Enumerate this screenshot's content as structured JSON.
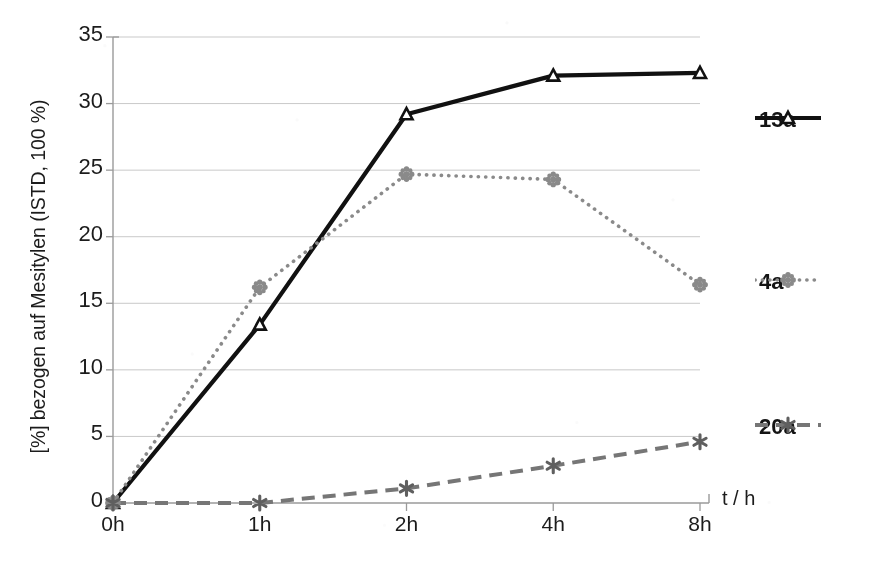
{
  "chart_data": {
    "type": "line",
    "title": "",
    "subtitle": "",
    "xlabel": "t / h",
    "ylabel": "[%] bezogen auf Mesitylen (ISTD, 100 %)",
    "categories": [
      "0h",
      "1h",
      "2h",
      "4h",
      "8h"
    ],
    "ylim": [
      0,
      35
    ],
    "ytick_labels": [
      "0",
      "5",
      "10",
      "15",
      "20",
      "25",
      "30",
      "35"
    ],
    "ytick_values": [
      0,
      5,
      10,
      15,
      20,
      25,
      30,
      35
    ],
    "grid": "horizontal",
    "legend_position": "right",
    "series": [
      {
        "name": "13a",
        "values": [
          0.0,
          13.4,
          29.2,
          32.1,
          32.3
        ],
        "color": "#111111",
        "line_style": "solid",
        "marker": "triangle"
      },
      {
        "name": "4a",
        "values": [
          0.0,
          16.2,
          24.7,
          24.3,
          16.4
        ],
        "color": "#8a8a8a",
        "line_style": "dotted",
        "marker": "flower"
      },
      {
        "name": "20a",
        "values": [
          0.0,
          0.0,
          1.1,
          2.8,
          4.6
        ],
        "color": "#767676",
        "line_style": "dashed",
        "marker": "star"
      }
    ]
  },
  "axes": {
    "y_title": "[%] bezogen auf Mesitylen (ISTD, 100 %)",
    "x_title": "t / h",
    "y_ticks": [
      {
        "label": "35",
        "value": 35
      },
      {
        "label": "30",
        "value": 30
      },
      {
        "label": "25",
        "value": 25
      },
      {
        "label": "20",
        "value": 20
      },
      {
        "label": "15",
        "value": 15
      },
      {
        "label": "10",
        "value": 10
      },
      {
        "label": "5",
        "value": 5
      },
      {
        "label": "0",
        "value": 0
      }
    ],
    "x_ticks": [
      {
        "label": "0h"
      },
      {
        "label": "1h"
      },
      {
        "label": "2h"
      },
      {
        "label": "4h"
      },
      {
        "label": "8h"
      }
    ]
  },
  "legend": {
    "items": [
      {
        "label": "13a",
        "color": "#111111",
        "line_style": "solid",
        "marker": "triangle"
      },
      {
        "label": "4a",
        "color": "#8a8a8a",
        "line_style": "dotted",
        "marker": "flower"
      },
      {
        "label": "20a",
        "color": "#767676",
        "line_style": "dashed",
        "marker": "star"
      }
    ]
  }
}
